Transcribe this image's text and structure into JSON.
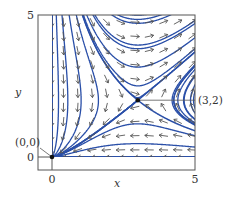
{
  "figure": {
    "system": {
      "dx": "x*(y-2)",
      "dy": "y*(x-3)"
    },
    "axes": {
      "xlabel": "x",
      "ylabel": "y",
      "x_ticks": [
        {
          "value": 0,
          "label": "0"
        },
        {
          "value": 5,
          "label": "5"
        }
      ],
      "y_ticks": [
        {
          "value": 0,
          "label": "0"
        },
        {
          "value": 5,
          "label": "5"
        }
      ],
      "xlim": [
        -0.5,
        5
      ],
      "ylim": [
        -0.45,
        5
      ]
    },
    "equilibria": [
      {
        "x": 0,
        "y": 0,
        "label": "(0,0)",
        "type": "stable node"
      },
      {
        "x": 3,
        "y": 2,
        "label": "(3,2)",
        "type": "saddle"
      }
    ],
    "colors": {
      "streamline": "#2a4fa8",
      "arrow": "#555555",
      "axis": "#555555",
      "point": "#111111"
    },
    "arrow_grid_step": 0.5
  }
}
